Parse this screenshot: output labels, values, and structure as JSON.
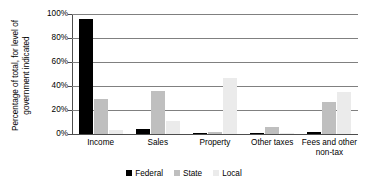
{
  "chart_data": {
    "type": "bar",
    "title": "",
    "xlabel": "",
    "ylabel": "Percentage of total, for level of government indicated",
    "ylabel_line1": "Percentage of total, for level of",
    "ylabel_line2": "government indicated",
    "categories": [
      "Income",
      "Sales",
      "Property",
      "Other taxes",
      "Fees and other non-tax"
    ],
    "category_lines": [
      {
        "l1": "Income",
        "l2": ""
      },
      {
        "l1": "Sales",
        "l2": ""
      },
      {
        "l1": "Property",
        "l2": ""
      },
      {
        "l1": "Other taxes",
        "l2": ""
      },
      {
        "l1": "Fees and other",
        "l2": "non-tax"
      }
    ],
    "series": [
      {
        "name": "Federal",
        "color": "#000000",
        "values": [
          96,
          4,
          0.3,
          0.3,
          2
        ]
      },
      {
        "name": "State",
        "color": "#bfbfbf",
        "values": [
          29,
          36,
          2,
          6,
          27
        ]
      },
      {
        "name": "Local",
        "color": "#ebebeb",
        "values": [
          3,
          11,
          47,
          1,
          35
        ]
      }
    ],
    "ylim": [
      0,
      100
    ],
    "ytick_values": [
      0,
      20,
      40,
      60,
      80,
      100
    ],
    "ytick_labels": [
      "0%",
      "20%",
      "40%",
      "60%",
      "80%",
      "100%"
    ],
    "grid": true,
    "legend_position": "bottom"
  },
  "legend": {
    "items": [
      {
        "label": "Federal",
        "swatch": "federal"
      },
      {
        "label": "State",
        "swatch": "state"
      },
      {
        "label": "Local",
        "swatch": "local"
      }
    ]
  }
}
